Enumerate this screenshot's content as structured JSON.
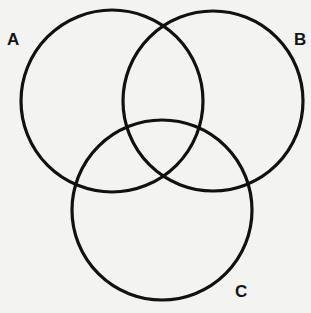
{
  "diagram": {
    "type": "venn",
    "background": "#f3f3f2",
    "stroke_color": "#111111",
    "sets": [
      {
        "label": "A",
        "cx": 112,
        "cy": 101,
        "r": 91,
        "label_x": 7,
        "label_y": 31
      },
      {
        "label": "B",
        "cx": 213,
        "cy": 101,
        "r": 90,
        "label_x": 294,
        "label_y": 31
      },
      {
        "label": "C",
        "cx": 162,
        "cy": 210,
        "r": 90,
        "label_x": 235,
        "label_y": 283
      }
    ]
  }
}
